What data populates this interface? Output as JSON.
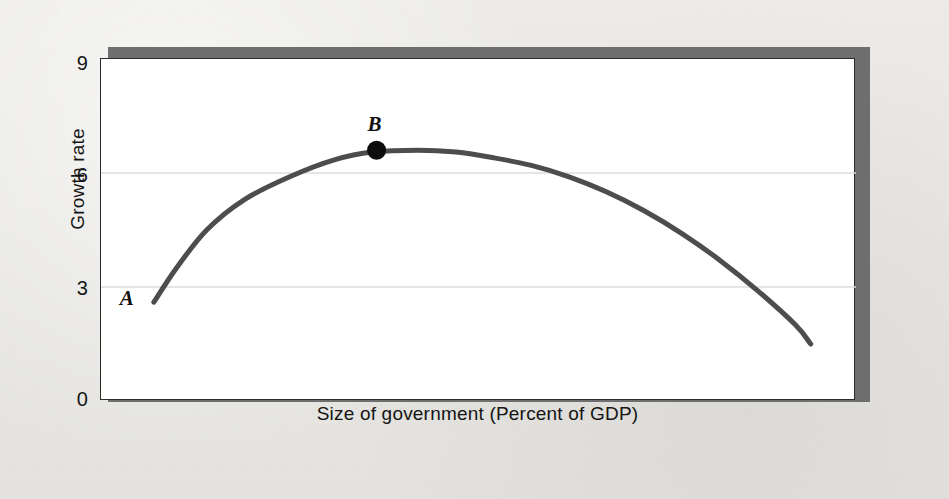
{
  "figure": {
    "background_color": "#e9e8e5",
    "plot_background_color": "#ffffff",
    "frame_color": "#2b2b2b",
    "shadow_color": "#6e6e6e"
  },
  "chart_data": {
    "type": "line",
    "title": "",
    "subtitle": "",
    "xlabel": "Size of government (Percent of GDP)",
    "ylabel": "Growth rate",
    "xlim": [
      0,
      100
    ],
    "ylim": [
      0,
      9
    ],
    "grid": true,
    "grid_color": "#dcdcdc",
    "legend": null,
    "legend_position": "none",
    "x_ticklabels": [],
    "y_ticklabels": [
      "0",
      "3",
      "6",
      "9"
    ],
    "y_tickvalues": [
      0,
      3,
      6,
      9
    ],
    "line_color": "#4d4d4d",
    "line_width": 5,
    "series": [
      {
        "name": "Growth rate vs size of government",
        "x": [
          7,
          10,
          14,
          19,
          25,
          31,
          36,
          42,
          47,
          52,
          57,
          62,
          67,
          72,
          77,
          82,
          87,
          92,
          94
        ],
        "y": [
          2.6,
          3.5,
          4.5,
          5.3,
          5.9,
          6.35,
          6.55,
          6.6,
          6.55,
          6.4,
          6.2,
          5.9,
          5.5,
          5.0,
          4.4,
          3.7,
          2.9,
          2.0,
          1.5
        ]
      }
    ],
    "annotations": [
      {
        "label": "A",
        "name": "point-a",
        "x": 7,
        "y": 2.6,
        "marker": "none",
        "note": "start of curve, labeled to the left"
      },
      {
        "label": "B",
        "name": "point-b",
        "x": 36.5,
        "y": 6.6,
        "marker": "filled-circle",
        "marker_color": "#0d0d0d",
        "note": "maximum growth rate"
      }
    ]
  }
}
